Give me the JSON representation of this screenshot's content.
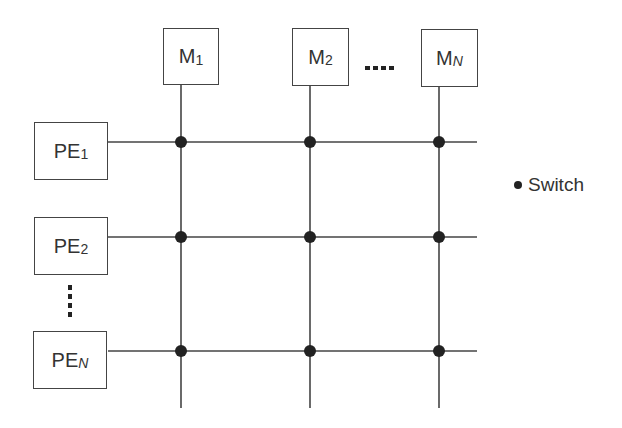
{
  "diagram": {
    "memories": [
      {
        "label": "M",
        "sub": "1",
        "sub_italic": false
      },
      {
        "label": "M",
        "sub": "2",
        "sub_italic": false
      },
      {
        "label": "M",
        "sub": "N",
        "sub_italic": true
      }
    ],
    "processors": [
      {
        "label": "PE",
        "sub": "1",
        "sub_italic": false
      },
      {
        "label": "PE",
        "sub": "2",
        "sub_italic": false
      },
      {
        "label": "PE",
        "sub": "N",
        "sub_italic": true
      }
    ],
    "legend": {
      "label": "Switch"
    },
    "colors": {
      "line": "#444444",
      "switch": "#222222"
    }
  }
}
